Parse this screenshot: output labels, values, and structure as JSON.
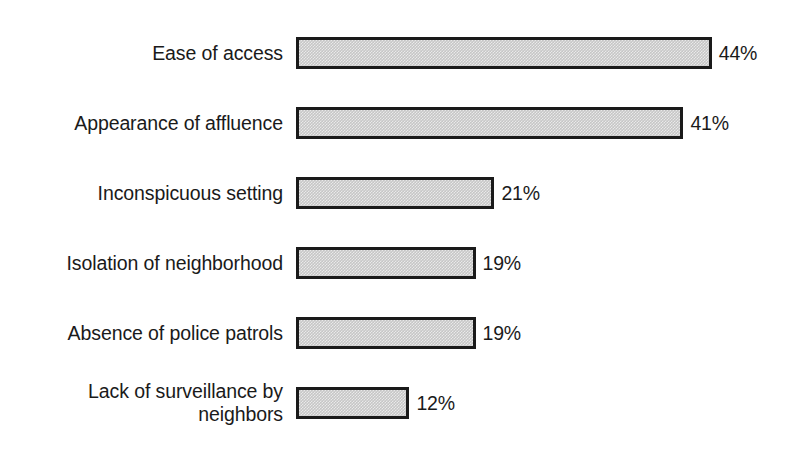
{
  "chart_data": {
    "type": "bar",
    "orientation": "horizontal",
    "title": "",
    "subtitle": "",
    "xlabel": "",
    "ylabel": "",
    "xlim": [
      0,
      50
    ],
    "grid": false,
    "legend": null,
    "value_suffix": "%",
    "categories": [
      "Ease of access",
      "Appearance of affluence",
      "Inconspicuous setting",
      "Isolation of neighborhood",
      "Absence of police patrols",
      "Lack of surveillance by\nneighbors"
    ],
    "values": [
      44,
      41,
      21,
      19,
      19,
      12
    ],
    "value_labels": [
      "44%",
      "41%",
      "21%",
      "19%",
      "19%",
      "12%"
    ],
    "bars": [
      {
        "label": "Ease of access",
        "value": 44,
        "value_label": "44%"
      },
      {
        "label": "Appearance of affluence",
        "value": 41,
        "value_label": "41%"
      },
      {
        "label": "Inconspicuous setting",
        "value": 21,
        "value_label": "21%"
      },
      {
        "label": "Isolation of neighborhood",
        "value": 19,
        "value_label": "19%"
      },
      {
        "label": "Absence of police patrols",
        "value": 19,
        "value_label": "19%"
      },
      {
        "label": "Lack of surveillance by\nneighbors",
        "value": 12,
        "value_label": "12%"
      }
    ],
    "colors": {
      "bar_fill": "#c6c6c6",
      "bar_border": "#1a1a1a",
      "text": "#1a1a1a",
      "background": "#ffffff"
    }
  },
  "layout": {
    "bar_origin_x": 296,
    "px_per_unit": 9.45,
    "row_tops": [
      36,
      106,
      176,
      246,
      316,
      386
    ],
    "bar_height": 32
  }
}
